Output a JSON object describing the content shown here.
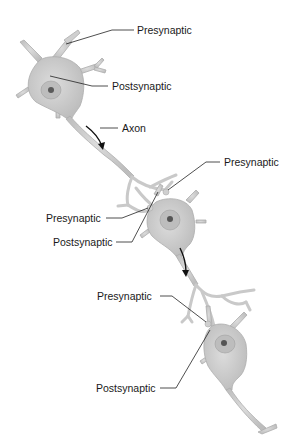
{
  "diagram": {
    "type": "neuron-chain",
    "colors": {
      "background": "#ffffff",
      "cell_fill": "#cdcdcd",
      "cell_stroke": "#b0b0b0",
      "nucleus": "#a9a9a9",
      "nucleolus": "#555555",
      "leader_line": "#222222",
      "label_text": "#1a1a1a"
    },
    "neurons": [
      {
        "id": "neuron-1",
        "role": "top"
      },
      {
        "id": "neuron-2",
        "role": "middle"
      },
      {
        "id": "neuron-3",
        "role": "bottom"
      }
    ],
    "labels": [
      {
        "id": "n1-presynaptic",
        "text": "Presynaptic"
      },
      {
        "id": "n1-postsynaptic",
        "text": "Postsynaptic"
      },
      {
        "id": "n1-axon",
        "text": "Axon"
      },
      {
        "id": "n2-presynaptic-right",
        "text": "Presynaptic"
      },
      {
        "id": "n2-presynaptic-left",
        "text": "Presynaptic"
      },
      {
        "id": "n2-postsynaptic",
        "text": "Postsynaptic"
      },
      {
        "id": "n3-presynaptic",
        "text": "Presynaptic"
      },
      {
        "id": "n3-postsynaptic",
        "text": "Postsynaptic"
      }
    ],
    "arrows": [
      {
        "id": "signal-arrow-1",
        "direction": "down"
      },
      {
        "id": "signal-arrow-2",
        "direction": "down"
      }
    ]
  }
}
